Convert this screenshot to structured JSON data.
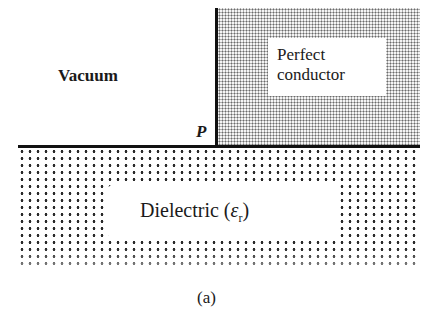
{
  "figure": {
    "regions": {
      "vacuum": {
        "label": "Vacuum"
      },
      "conductor": {
        "label_line1": "Perfect",
        "label_line2": "conductor"
      },
      "dielectric": {
        "label": "Dielectric (",
        "symbol": "ε",
        "subscript": "r",
        "label_close": ")"
      }
    },
    "point": {
      "label": "P"
    },
    "caption": "(a)"
  }
}
